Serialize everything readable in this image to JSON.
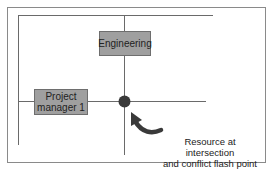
{
  "diagram": {
    "boxes": {
      "engineering": "Engineering",
      "project_manager_line1": "Project",
      "project_manager_line2": "manager 1"
    },
    "caption": {
      "line1": "Resource at intersection",
      "line2": "and conflict flash point"
    },
    "colors": {
      "box_fill": "#9f9f9f",
      "line": "#6a6a6a",
      "dot": "#3a3a3a",
      "arrow": "#3a3a3a",
      "frame": "#8a8a8a"
    }
  }
}
